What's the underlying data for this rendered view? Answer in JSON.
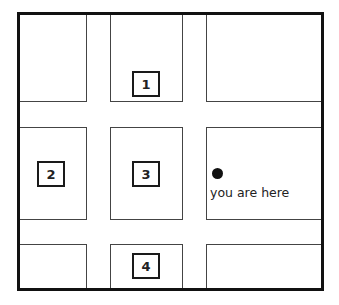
{
  "map": {
    "title": "",
    "labels": [
      {
        "id": "1",
        "text": "1"
      },
      {
        "id": "2",
        "text": "2"
      },
      {
        "id": "3",
        "text": "3"
      },
      {
        "id": "4",
        "text": "4"
      }
    ],
    "marker": {
      "text": "you are here"
    },
    "colors": {
      "line": "#111111",
      "background": "#ffffff"
    }
  }
}
